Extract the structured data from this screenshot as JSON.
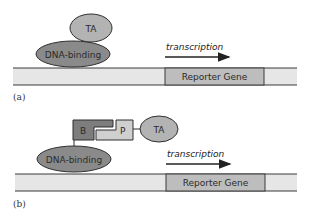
{
  "colors": {
    "dna_fill": "#e6e6e6",
    "dna_stroke": "#3a3a3a",
    "reporter_fill": "#bdbdbd",
    "ta_fill": "#b3b3b3",
    "dna_binding_fill": "#8a8a8a",
    "b_fill": "#7d7d7d",
    "p_fill": "#cfcfcf"
  },
  "panel_a": {
    "caption": "(a)",
    "ta_label": "TA",
    "dna_binding_label": "DNA-binding",
    "transcription_label": "transcription",
    "reporter_label": "Reporter Gene"
  },
  "panel_b": {
    "caption": "(b)",
    "b_label": "B",
    "p_label": "P",
    "ta_label": "TA",
    "dna_binding_label": "DNA-binding",
    "transcription_label": "transcription",
    "reporter_label": "Reporter Gene"
  }
}
